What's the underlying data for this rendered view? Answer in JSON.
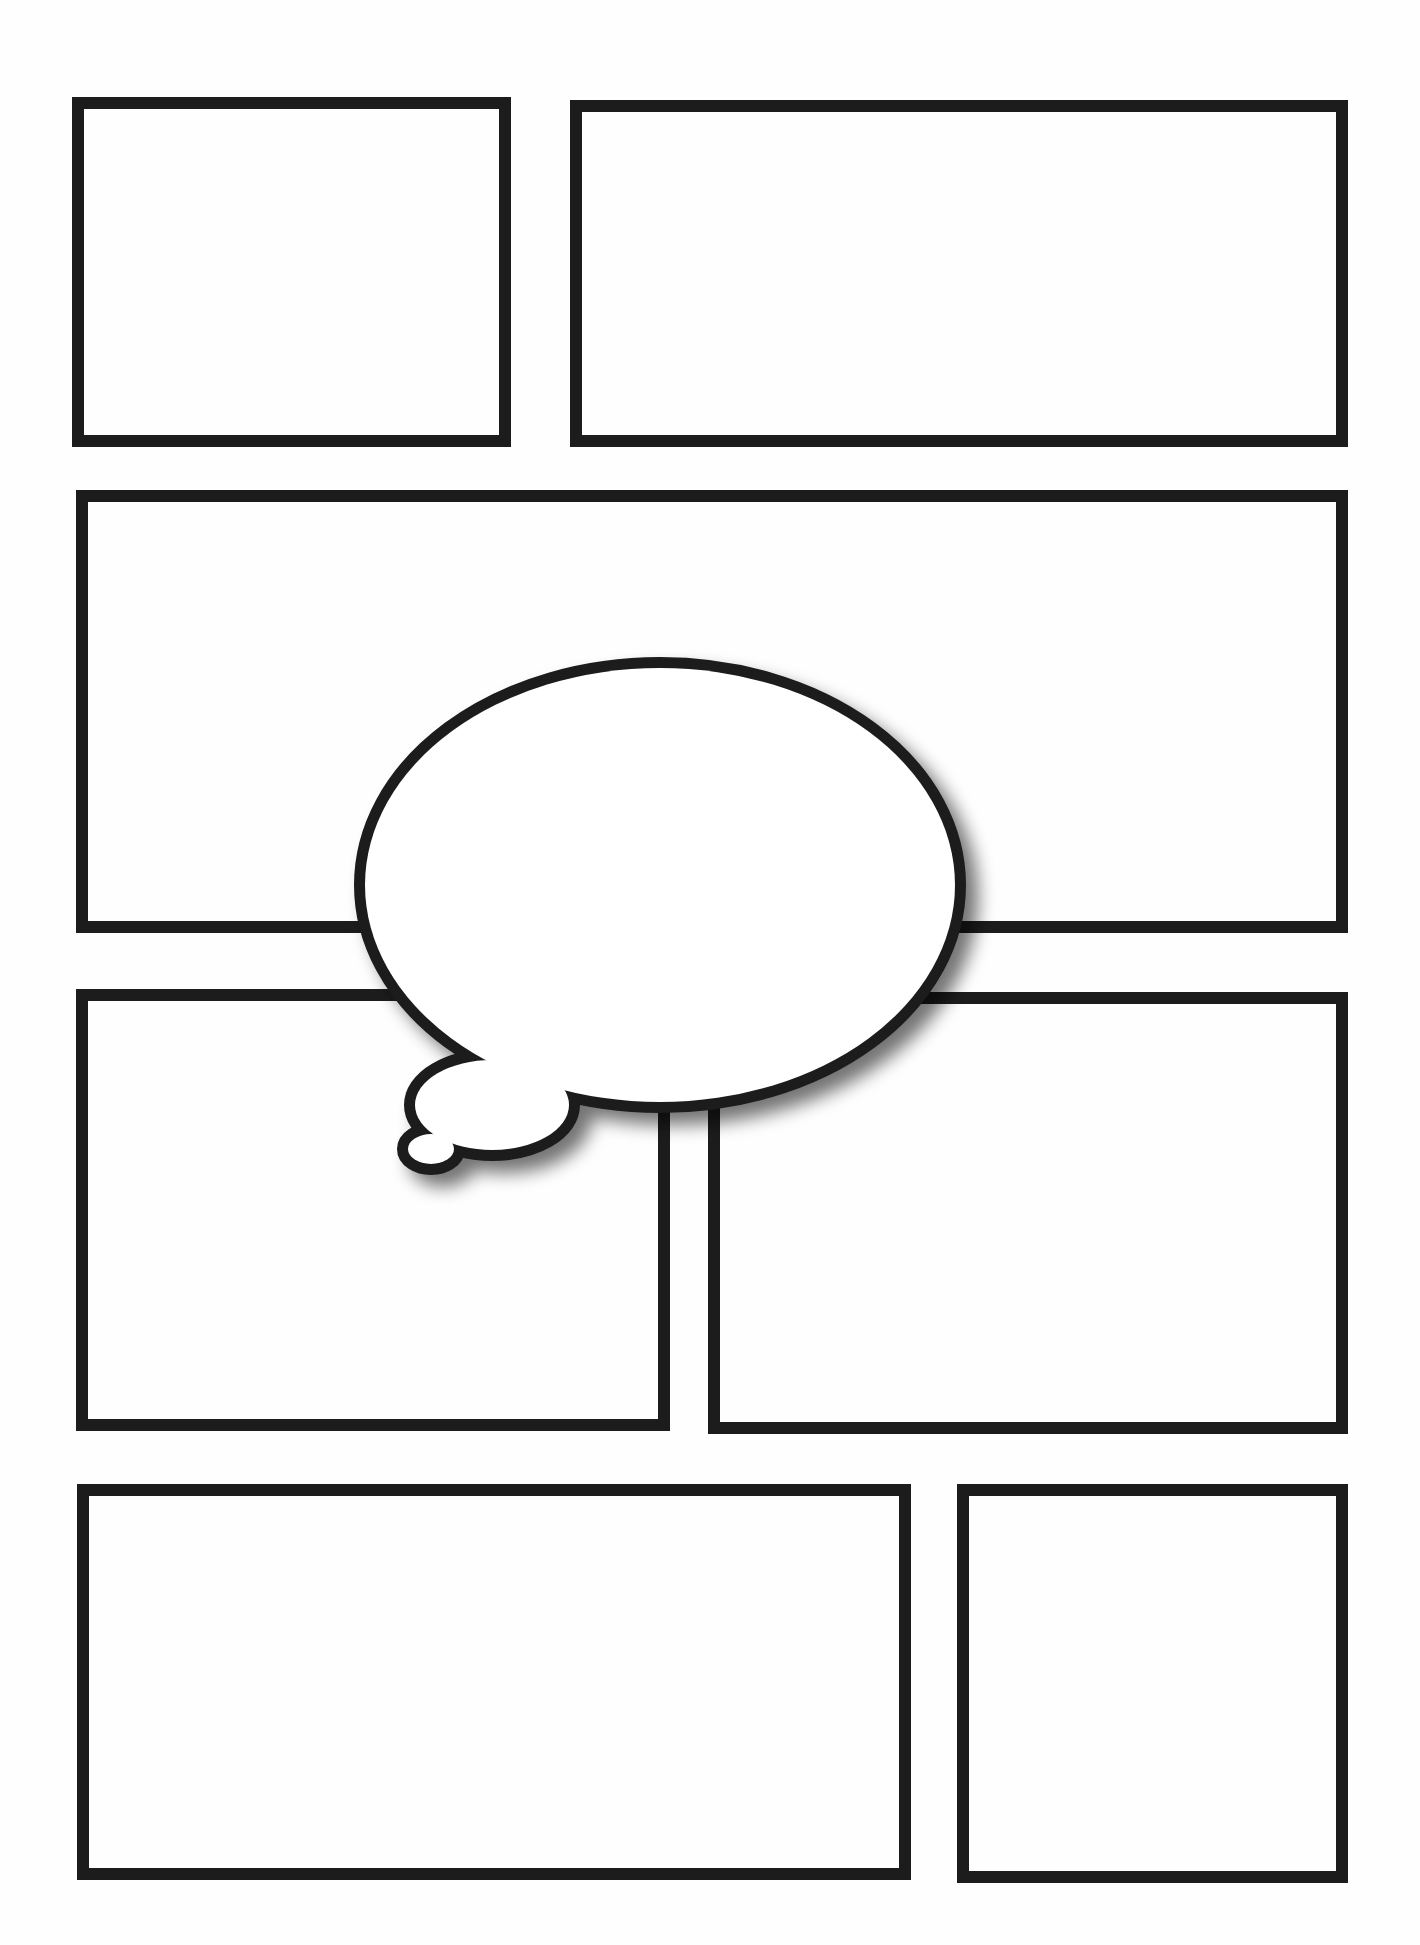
{
  "page": {
    "width": 1420,
    "height": 1945,
    "background": "#fefefe",
    "line_color": "#1c1c1c",
    "border_width": 12
  },
  "panels": [
    {
      "id": "panel-1",
      "x": 72,
      "y": 97,
      "w": 439,
      "h": 350
    },
    {
      "id": "panel-2",
      "x": 570,
      "y": 100,
      "w": 778,
      "h": 347
    },
    {
      "id": "panel-3",
      "x": 76,
      "y": 490,
      "w": 1272,
      "h": 443
    },
    {
      "id": "panel-4",
      "x": 76,
      "y": 989,
      "w": 594,
      "h": 442
    },
    {
      "id": "panel-5",
      "x": 708,
      "y": 992,
      "w": 640,
      "h": 442
    },
    {
      "id": "panel-6",
      "x": 77,
      "y": 1484,
      "w": 834,
      "h": 396
    },
    {
      "id": "panel-7",
      "x": 957,
      "y": 1484,
      "w": 391,
      "h": 399
    }
  ],
  "thought_bubble": {
    "fill": "#ffffff",
    "stroke": "#1c1c1c",
    "stroke_width": 11,
    "shadow_color": "rgba(0,0,0,0.55)",
    "shadow_offset": [
      12,
      12
    ],
    "shadow_blur": 9,
    "main": {
      "cx": 660,
      "cy": 885,
      "rx": 295,
      "ry": 217
    },
    "mid": {
      "cx": 492,
      "cy": 1105,
      "rx": 77,
      "ry": 45
    },
    "small": {
      "cx": 431,
      "cy": 1149,
      "rx": 23,
      "ry": 15
    }
  }
}
